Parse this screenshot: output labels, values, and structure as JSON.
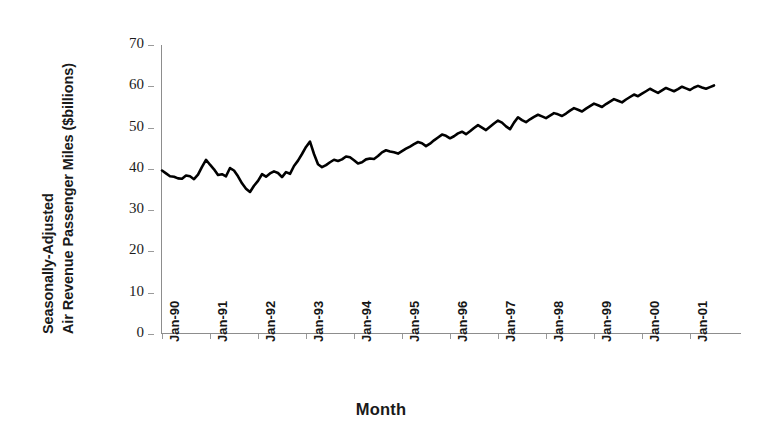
{
  "chart_data": {
    "type": "line",
    "title": "",
    "xlabel": "Month",
    "ylabel": "Seasonally-Adjusted Air Revenue Passenger Miles ($billions)",
    "ylabel_lines": [
      "Seasonally-Adjusted",
      "Air Revenue Passenger Miles ($billions)"
    ],
    "ylim": [
      0,
      70
    ],
    "yticks": [
      0,
      10,
      20,
      30,
      40,
      50,
      60,
      70
    ],
    "ytick_labels": [
      "0",
      "10",
      "20",
      "30",
      "40",
      "50",
      "60",
      "70"
    ],
    "xtick_labels": [
      "Jan-90",
      "Jan-91",
      "Jan-92",
      "Jan-93",
      "Jan-94",
      "Jan-95",
      "Jan-96",
      "Jan-97",
      "Jan-98",
      "Jan-99",
      "Jan-00",
      "Jan-01"
    ],
    "xtick_index": [
      0,
      12,
      24,
      36,
      48,
      60,
      72,
      84,
      96,
      108,
      120,
      132
    ],
    "grid": false,
    "legend": "none",
    "line_color": "#000000",
    "line_width": 2.6,
    "x_start": "Jan-90",
    "x_end": "Jul-01",
    "n_points": 139,
    "series": [
      {
        "name": "Air Revenue Passenger Miles",
        "values": [
          39.6,
          38.9,
          38.2,
          38.1,
          37.7,
          37.6,
          38.4,
          38.2,
          37.5,
          38.6,
          40.5,
          42.2,
          41.0,
          39.9,
          38.5,
          38.7,
          38.2,
          40.2,
          39.6,
          38.2,
          36.5,
          35.2,
          34.4,
          35.9,
          37.1,
          38.7,
          38.1,
          38.9,
          39.4,
          39.0,
          38.0,
          39.2,
          38.8,
          40.7,
          42.0,
          43.6,
          45.3,
          46.6,
          43.6,
          41.1,
          40.4,
          40.9,
          41.6,
          42.2,
          41.9,
          42.3,
          43.0,
          42.8,
          42.1,
          41.3,
          41.6,
          42.3,
          42.5,
          42.4,
          43.1,
          44.0,
          44.5,
          44.2,
          44.0,
          43.7,
          44.3,
          44.9,
          45.4,
          46.0,
          46.5,
          46.2,
          45.5,
          46.1,
          46.9,
          47.6,
          48.3,
          48.0,
          47.4,
          47.9,
          48.6,
          49.0,
          48.4,
          49.1,
          49.9,
          50.6,
          50.0,
          49.4,
          50.2,
          51.0,
          51.7,
          51.2,
          50.3,
          49.6,
          51.2,
          52.5,
          51.8,
          51.3,
          52.0,
          52.6,
          53.1,
          52.7,
          52.3,
          52.9,
          53.5,
          53.2,
          52.8,
          53.4,
          54.1,
          54.7,
          54.3,
          53.9,
          54.6,
          55.2,
          55.8,
          55.4,
          55.0,
          55.7,
          56.3,
          56.9,
          56.5,
          56.1,
          56.8,
          57.4,
          58.0,
          57.6,
          58.2,
          58.8,
          59.4,
          58.9,
          58.4,
          59.0,
          59.6,
          59.2,
          58.8,
          59.3,
          59.9,
          59.5,
          59.1,
          59.7,
          60.1,
          59.7,
          59.4,
          59.8,
          60.2
        ]
      }
    ]
  }
}
